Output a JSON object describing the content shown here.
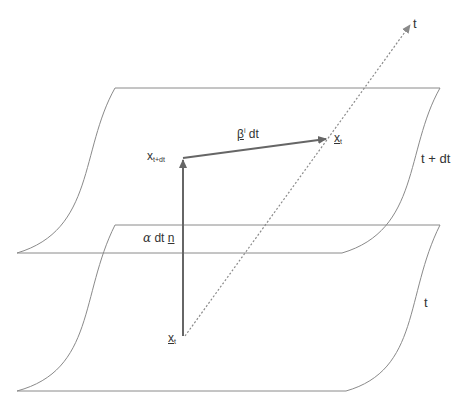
{
  "diagram": {
    "colors": {
      "surface_line": "#8a8a8a",
      "arrow": "#666666",
      "time_axis": "#8a8a8a",
      "text": "#333333"
    },
    "time_axis": {
      "label": "t"
    },
    "surfaces": [
      {
        "name": "upper",
        "label": "t + dt"
      },
      {
        "name": "lower",
        "label": "t"
      }
    ],
    "points": {
      "x_t_lower": {
        "base": "x",
        "sub": "t"
      },
      "x_t_upper": {
        "base": "x",
        "sub": "t"
      },
      "x_t_plus_dt": {
        "base": "x",
        "sub": "t+dt"
      }
    },
    "vectors": {
      "normal": {
        "prefix": "α",
        "mid": " dt ",
        "vec": "n"
      },
      "shift": {
        "vec": "β",
        "sup": "i",
        "suffix": " dt"
      }
    }
  }
}
